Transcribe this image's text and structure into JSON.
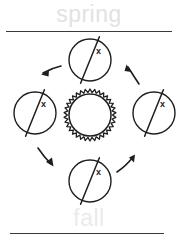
{
  "diagram": {
    "labels": {
      "top": "spring",
      "bottom": "fall"
    },
    "colors": {
      "stroke": "#1e1e1e",
      "divider": "#3a3a3a",
      "label_top": "#e2e2e2",
      "label_bottom": "#ebebeb",
      "background": "#ffffff"
    },
    "sun": {
      "name": "sun",
      "center_x": 90,
      "center_y": 115,
      "core_radius": 21,
      "ray_outer_radius": 26,
      "ray_count": 34
    },
    "earths": [
      {
        "position": "top",
        "center_x": 90,
        "center_y": 60,
        "radius": 21,
        "axis_label": "x",
        "axis_tilt_deg": 23
      },
      {
        "position": "left",
        "center_x": 35,
        "center_y": 113,
        "radius": 21,
        "axis_label": "x",
        "axis_tilt_deg": 23
      },
      {
        "position": "right",
        "center_x": 154,
        "center_y": 113,
        "radius": 21,
        "axis_label": "x",
        "axis_tilt_deg": 23
      },
      {
        "position": "bottom",
        "center_x": 90,
        "center_y": 181,
        "radius": 21,
        "axis_label": "x",
        "axis_tilt_deg": 23
      }
    ],
    "arrows": [
      {
        "position": "top-left",
        "direction": "down-left"
      },
      {
        "position": "top-right",
        "direction": "up-left"
      },
      {
        "position": "bottom-left",
        "direction": "down-right"
      },
      {
        "position": "bottom-right",
        "direction": "up-right"
      }
    ],
    "dividers": [
      {
        "position": "top"
      },
      {
        "position": "bottom"
      }
    ]
  }
}
